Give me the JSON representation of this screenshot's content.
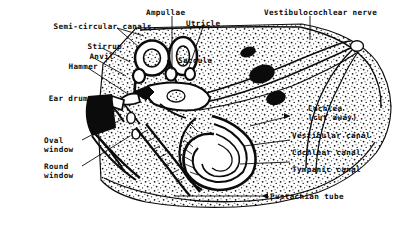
{
  "figure": {
    "background_color": "#ffffff",
    "ink_color": "#0b0b0b",
    "width": 415,
    "height": 226
  },
  "labels": {
    "semicircular_canals": "Semi-circular canals",
    "stirrup": "Stirrup",
    "anvil": "Anvil",
    "hammer": "Hammer",
    "ear_drum": "Ear drum",
    "oval_window": "Oval\nwindow",
    "round_window": "Round\nwindow",
    "ampullae": "Ampullae",
    "utricle": "Utricle",
    "saccule": "Saccule",
    "vestibulocochlear_nerve": "Vestibulocochlear nerve",
    "cochlea_cut_away": "Cochlea\n(cut away)",
    "vestibular_canal": "Vestibular canal",
    "cochlear_canal": "Cochlear canal",
    "tympanic_canal": "Tympanic canal",
    "eustachian_tube": "Eustachian tube"
  }
}
